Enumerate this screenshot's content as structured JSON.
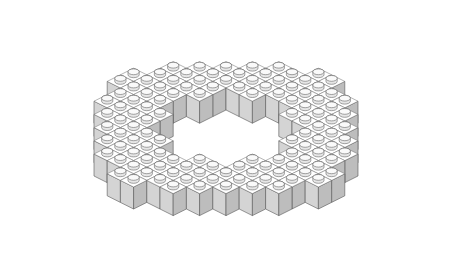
{
  "image": {
    "subject": "Line illustration of toy building bricks arranged in a stepped ring with an empty center",
    "colors": {
      "top": "#ffffff",
      "left_face": "#d4d4d4",
      "right_face": "#bdbdbd",
      "outline": "#555555",
      "background": "#ffffff"
    }
  },
  "geometry": {
    "origin_x": 226,
    "origin_y": 22,
    "step_x": 13.2,
    "step_y": 6.6,
    "height": 22,
    "grid_size": 16,
    "outer_radius": 8.2,
    "inner_radius": 4.3,
    "center": 7.5
  }
}
